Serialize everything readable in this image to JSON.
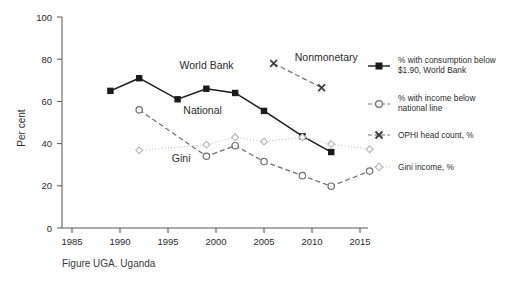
{
  "chart_data": {
    "type": "line",
    "title": "",
    "subtitle": "",
    "caption": "Figure UGA. Uganda",
    "xlabel": "",
    "ylabel": "Per cent",
    "xlim": [
      1984,
      2018
    ],
    "ylim": [
      0,
      100
    ],
    "grid": false,
    "legend_position": "right",
    "xticks": [
      1985,
      1990,
      1995,
      2000,
      2005,
      2010,
      2015
    ],
    "yticks": [
      0,
      20,
      40,
      60,
      80,
      100
    ],
    "series": [
      {
        "name": "% with consumption below $1.90, World Bank",
        "short_name": "World Bank",
        "marker": "filled-square",
        "line_style": "solid",
        "color": "#1a1a1a",
        "points": [
          {
            "x": 1989,
            "y": 65
          },
          {
            "x": 1992,
            "y": 71
          },
          {
            "x": 1996,
            "y": 61
          },
          {
            "x": 1999,
            "y": 66
          },
          {
            "x": 2002,
            "y": 64
          },
          {
            "x": 2005,
            "y": 55.5
          },
          {
            "x": 2009,
            "y": 43.5
          },
          {
            "x": 2012,
            "y": 36
          }
        ]
      },
      {
        "name": "% with income below national line",
        "short_name": "National",
        "marker": "open-circle",
        "line_style": "dashed",
        "color": "#6e6e6e",
        "points": [
          {
            "x": 1992,
            "y": 56
          },
          {
            "x": 1999,
            "y": 34
          },
          {
            "x": 2002,
            "y": 39
          },
          {
            "x": 2005,
            "y": 31.5
          },
          {
            "x": 2009,
            "y": 24.8
          },
          {
            "x": 2012,
            "y": 19.8
          },
          {
            "x": 2016,
            "y": 27
          }
        ]
      },
      {
        "name": "OPHI head count, %",
        "short_name": "Nonmonetary",
        "marker": "cross-x",
        "line_style": "dashed",
        "color": "#6e6e6e",
        "points": [
          {
            "x": 2006,
            "y": 78
          },
          {
            "x": 2011,
            "y": 66.5
          }
        ]
      },
      {
        "name": "Gini income, %",
        "short_name": "Gini",
        "marker": "open-diamond",
        "line_style": "dotted",
        "color": "#c2c2c2",
        "points": [
          {
            "x": 1992,
            "y": 36.8
          },
          {
            "x": 1999,
            "y": 39.5
          },
          {
            "x": 2002,
            "y": 43
          },
          {
            "x": 2005,
            "y": 41
          },
          {
            "x": 2009,
            "y": 43
          },
          {
            "x": 2012,
            "y": 39.8
          },
          {
            "x": 2016,
            "y": 37.3
          }
        ]
      }
    ],
    "annotations": [
      {
        "text": "World Bank",
        "x": 1996.2,
        "y": 75.5
      },
      {
        "text": "National",
        "x": 1996.6,
        "y": 54
      },
      {
        "text": "Gini",
        "x": 1995.4,
        "y": 31.5
      },
      {
        "text": "Nonmonetary",
        "x": 2008.2,
        "y": 79
      }
    ]
  },
  "legend": {
    "items": [
      {
        "label_line1": "% with consumption below",
        "label_line2": "$1.90, World Bank",
        "marker": "filled-square",
        "line_style": "solid"
      },
      {
        "label_line1": "% with income below",
        "label_line2": "national line",
        "marker": "open-circle",
        "line_style": "dashed"
      },
      {
        "label_line1": "OPHI head count, %",
        "label_line2": "",
        "marker": "cross-x",
        "line_style": "dashed"
      },
      {
        "label_line1": "Gini income, %",
        "label_line2": "",
        "marker": "open-diamond",
        "line_style": "dotted"
      }
    ]
  },
  "axis": {
    "y_title": "Per cent",
    "y_tick_0": "0",
    "y_tick_20": "20",
    "y_tick_40": "40",
    "y_tick_60": "60",
    "y_tick_80": "80",
    "y_tick_100": "100",
    "x_tick_1985": "1985",
    "x_tick_1990": "1990",
    "x_tick_1995": "1995",
    "x_tick_2000": "2000",
    "x_tick_2005": "2005",
    "x_tick_2010": "2010",
    "x_tick_2015": "2015"
  },
  "caption": {
    "text": "Figure UGA. Uganda"
  },
  "colors": {
    "series_dark": "#1a1a1a",
    "series_mid": "#6e6e6e",
    "series_light": "#c2c2c2",
    "axis": "#555555",
    "text": "#2b2b2b"
  }
}
